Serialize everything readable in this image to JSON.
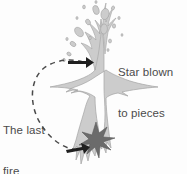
{
  "figure": {
    "width": 187,
    "height": 174,
    "background_color": "#fdfdfd"
  },
  "labels": {
    "star_blown": "Star blown\nto pieces",
    "star_blown_line1": "Star blown",
    "star_blown_line2": "to pieces",
    "last_fire": "The last\nfire",
    "last_fire_line1": "The last",
    "last_fire_line2": "fire"
  },
  "colors": {
    "explosion_fill": "#cccccc",
    "explosion_stroke": "#9a9a9a",
    "core_star_fill": "#6b6b6b",
    "core_star_stroke": "#5a5a5a",
    "dashed_curve": "#4a4a4a",
    "arrow": "#1f1f1f",
    "text": "#4b4b4b",
    "background": "#fdfdfd"
  },
  "elements": {
    "explosion_body_name": "explosion-plume-shape",
    "core_star_name": "core-burst-star",
    "dashed_arc_name": "dashed-connector-arc",
    "upper_arrow_name": "upper-arrow-head",
    "lower_arrow_name": "lower-arrow-head",
    "debris_name": "debris-fragments"
  },
  "debris_fragments": [
    {
      "cx": 96,
      "cy": 10,
      "rx": 3.0,
      "ry": 4.6,
      "rot": -15
    },
    {
      "cx": 105,
      "cy": 14,
      "rx": 4.0,
      "ry": 5.6,
      "rot": 12
    },
    {
      "cx": 88,
      "cy": 22,
      "rx": 2.2,
      "ry": 3.0,
      "rot": -30
    },
    {
      "cx": 104,
      "cy": 29,
      "rx": 3.4,
      "ry": 5.0,
      "rot": 5
    },
    {
      "cx": 79,
      "cy": 32,
      "rx": 3.6,
      "ry": 5.4,
      "rot": -40
    },
    {
      "cx": 114,
      "cy": 26,
      "rx": 1.6,
      "ry": 2.2,
      "rot": 0
    },
    {
      "cx": 73,
      "cy": 44,
      "rx": 2.2,
      "ry": 3.2,
      "rot": -55
    },
    {
      "cx": 110,
      "cy": 41,
      "rx": 1.5,
      "ry": 2.0,
      "rot": 0
    },
    {
      "cx": 84,
      "cy": 7,
      "rx": 1.4,
      "ry": 1.9,
      "rot": 0
    },
    {
      "cx": 113,
      "cy": 8,
      "rx": 1.5,
      "ry": 2.1,
      "rot": 20
    },
    {
      "cx": 69,
      "cy": 54,
      "rx": 1.7,
      "ry": 2.3,
      "rot": -60
    },
    {
      "cx": 119,
      "cy": 18,
      "rx": 1.2,
      "ry": 1.6,
      "rot": 0
    },
    {
      "cx": 90,
      "cy": 38,
      "rx": 1.3,
      "ry": 1.8,
      "rot": 0
    },
    {
      "cx": 64,
      "cy": 60,
      "rx": 1.3,
      "ry": 1.7,
      "rot": 0
    },
    {
      "cx": 77,
      "cy": 18,
      "rx": 1.1,
      "ry": 1.5,
      "rot": 0
    },
    {
      "cx": 108,
      "cy": 50,
      "rx": 1.1,
      "ry": 1.5,
      "rot": 0
    },
    {
      "cx": 67,
      "cy": 39,
      "rx": 1.2,
      "ry": 1.6,
      "rot": 0
    },
    {
      "cx": 122,
      "cy": 35,
      "rx": 1.0,
      "ry": 1.4,
      "rot": 0
    },
    {
      "cx": 96,
      "cy": 2,
      "rx": 1.1,
      "ry": 1.5,
      "rot": 0
    }
  ]
}
